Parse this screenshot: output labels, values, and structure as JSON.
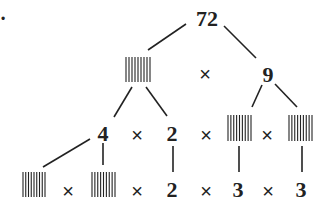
{
  "diagram": {
    "type": "factor-tree",
    "bullet_marker": "•",
    "root": "72",
    "levels": [
      {
        "items": [
          {
            "kind": "blank",
            "label": "blank"
          },
          {
            "kind": "operator",
            "label": "×"
          },
          {
            "kind": "number",
            "label": "9"
          }
        ]
      },
      {
        "items": [
          {
            "kind": "number",
            "label": "4"
          },
          {
            "kind": "operator",
            "label": "×"
          },
          {
            "kind": "number",
            "label": "2"
          },
          {
            "kind": "operator",
            "label": "×"
          },
          {
            "kind": "blank",
            "label": "blank"
          },
          {
            "kind": "operator",
            "label": "×"
          },
          {
            "kind": "blank",
            "label": "blank"
          }
        ]
      },
      {
        "items": [
          {
            "kind": "blank",
            "label": "blank"
          },
          {
            "kind": "operator",
            "label": "×"
          },
          {
            "kind": "blank",
            "label": "blank"
          },
          {
            "kind": "operator",
            "label": "×"
          },
          {
            "kind": "number",
            "label": "2"
          },
          {
            "kind": "operator",
            "label": "×"
          },
          {
            "kind": "number",
            "label": "3"
          },
          {
            "kind": "operator",
            "label": "×"
          },
          {
            "kind": "number",
            "label": "3"
          }
        ]
      }
    ]
  }
}
